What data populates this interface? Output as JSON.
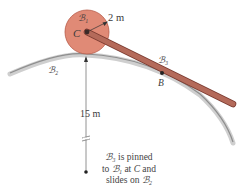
{
  "diagram": {
    "bodies": {
      "disk": {
        "label": "ℬ₁",
        "fill": "#e08a76",
        "stroke": "#b85a48"
      },
      "track": {
        "label": "ℬ₂",
        "color": "#a8a8a8"
      },
      "bar": {
        "label": "ℬ₃",
        "fill": "#b46a5a",
        "stroke": "#7a3a30"
      }
    },
    "points": {
      "center": {
        "label": "C"
      },
      "contact": {
        "label": "B"
      }
    },
    "dimensions": {
      "disk_radius": "2 m",
      "track_radius": "15 m"
    },
    "note": {
      "line1_sym": "ℬ₃",
      "line1_text": " is pinned",
      "line2_pre": "to ",
      "line2_sym": "ℬ₁",
      "line2_mid": " at ",
      "line2_pt": "C",
      "line2_post": " and",
      "line3_pre": "slides on ",
      "line3_sym": "ℬ₂"
    }
  }
}
